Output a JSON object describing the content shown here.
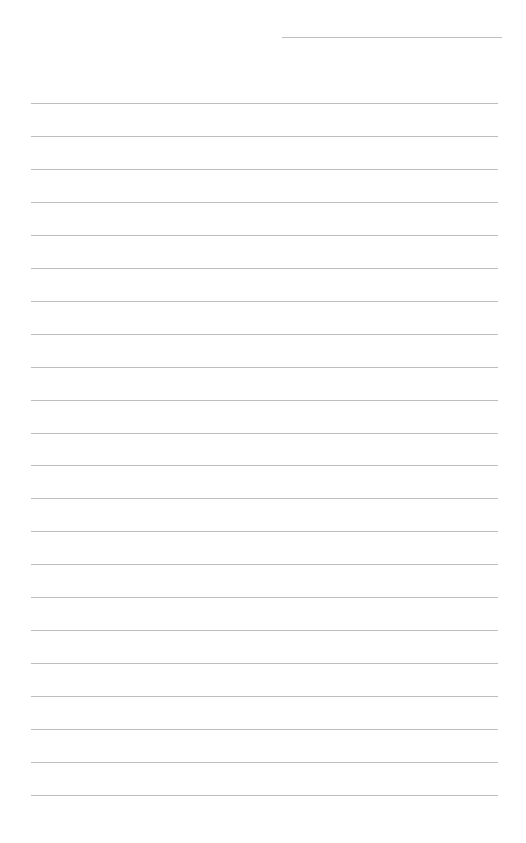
{
  "document": {
    "type": "lined-paper",
    "header_line": {
      "label": "",
      "x": 282,
      "y": 37,
      "width": 220
    },
    "rules": {
      "count": 22,
      "first_y": 103,
      "spacing": 32.95,
      "x": 31,
      "width": 467
    },
    "colors": {
      "background": "#ffffff",
      "rule": "#bdbdbd"
    }
  }
}
